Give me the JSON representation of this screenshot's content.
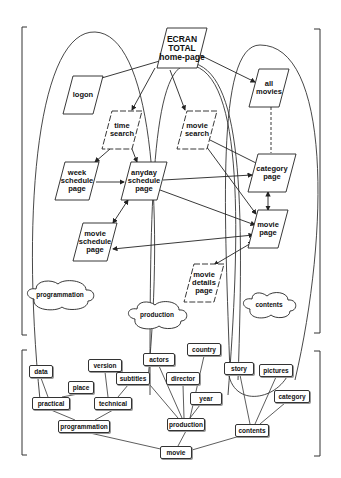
{
  "diagram": {
    "top_section": {
      "pages": [
        {
          "id": "home",
          "label": "ECRAN\nTOTAL\nhome-page",
          "cx": 182,
          "cy": 48,
          "w": 40,
          "h": 40
        },
        {
          "id": "logon",
          "label": "logon",
          "cx": 83,
          "cy": 95,
          "w": 30,
          "h": 38
        },
        {
          "id": "time-search",
          "label": "time\nsearch",
          "cx": 122,
          "cy": 130,
          "w": 30,
          "h": 38
        },
        {
          "id": "movie-search",
          "label": "movie\nsearch",
          "cx": 197,
          "cy": 130,
          "w": 30,
          "h": 38
        },
        {
          "id": "all-movies",
          "label": "all\nmovies",
          "cx": 269,
          "cy": 88,
          "w": 30,
          "h": 38
        },
        {
          "id": "week-schedule",
          "label": "week\nschedule\npage",
          "cx": 77,
          "cy": 181,
          "w": 34,
          "h": 38
        },
        {
          "id": "anyday-schedule",
          "label": "anyday\nschedule\npage",
          "cx": 144,
          "cy": 181,
          "w": 36,
          "h": 38
        },
        {
          "id": "category-page",
          "label": "category\npage",
          "cx": 272,
          "cy": 173,
          "w": 38,
          "h": 38
        },
        {
          "id": "movie-page",
          "label": "movie\npage",
          "cx": 268,
          "cy": 229,
          "w": 30,
          "h": 38
        },
        {
          "id": "movie-schedule",
          "label": "movie\nschedule\npage",
          "cx": 95,
          "cy": 242,
          "w": 34,
          "h": 38
        },
        {
          "id": "movie-details",
          "label": "movie\ndetails\npage",
          "cx": 204,
          "cy": 283,
          "w": 30,
          "h": 38
        }
      ],
      "clouds": [
        {
          "id": "programmation",
          "label": "programmation",
          "cx": 60,
          "cy": 295
        },
        {
          "id": "production",
          "label": "production",
          "cx": 157,
          "cy": 315
        },
        {
          "id": "contents",
          "label": "contents",
          "cx": 269,
          "cy": 305
        }
      ]
    },
    "bottom_section": {
      "tags": [
        {
          "id": "data",
          "label": "data",
          "x": 29,
          "y": 365,
          "w": 24,
          "h": 13
        },
        {
          "id": "place",
          "label": "place",
          "x": 68,
          "y": 381,
          "w": 26,
          "h": 13
        },
        {
          "id": "version",
          "label": "version",
          "x": 88,
          "y": 359,
          "w": 34,
          "h": 13
        },
        {
          "id": "subtitles",
          "label": "subtitles",
          "x": 116,
          "y": 372,
          "w": 34,
          "h": 13
        },
        {
          "id": "actors",
          "label": "actors",
          "x": 143,
          "y": 353,
          "w": 32,
          "h": 13
        },
        {
          "id": "country",
          "label": "country",
          "x": 187,
          "y": 343,
          "w": 34,
          "h": 13
        },
        {
          "id": "director",
          "label": "director",
          "x": 166,
          "y": 372,
          "w": 34,
          "h": 13
        },
        {
          "id": "year",
          "label": "year",
          "x": 190,
          "y": 392,
          "w": 32,
          "h": 13
        },
        {
          "id": "story",
          "label": "story",
          "x": 224,
          "y": 362,
          "w": 30,
          "h": 13
        },
        {
          "id": "pictures",
          "label": "pictures",
          "x": 259,
          "y": 364,
          "w": 34,
          "h": 13
        },
        {
          "id": "category",
          "label": "category",
          "x": 274,
          "y": 390,
          "w": 36,
          "h": 13
        },
        {
          "id": "practical",
          "label": "practical",
          "x": 32,
          "y": 397,
          "w": 38,
          "h": 13
        },
        {
          "id": "technical",
          "label": "technical",
          "x": 94,
          "y": 397,
          "w": 38,
          "h": 13
        },
        {
          "id": "programmation-tag",
          "label": "programmation",
          "x": 58,
          "y": 420,
          "w": 52,
          "h": 13
        },
        {
          "id": "production-tag",
          "label": "production",
          "x": 167,
          "y": 418,
          "w": 38,
          "h": 13
        },
        {
          "id": "contents-tag",
          "label": "contents",
          "x": 235,
          "y": 424,
          "w": 34,
          "h": 13
        },
        {
          "id": "movie-tag",
          "label": "movie",
          "x": 160,
          "y": 446,
          "w": 32,
          "h": 13
        }
      ]
    }
  }
}
